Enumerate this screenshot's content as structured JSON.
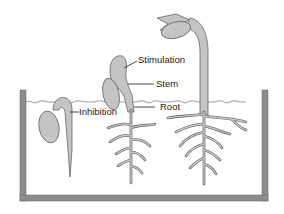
{
  "diagram": {
    "labels": {
      "stimulation": "Stimulation",
      "stem": "Stem",
      "root": "Root",
      "inhibition": "Inhibition"
    },
    "seedlings": [
      {
        "name": "early-seedling",
        "stage": "hook emerging from soil"
      },
      {
        "name": "middle-seedling",
        "stage": "bent shoot with developing roots"
      },
      {
        "name": "mature-seedling",
        "stage": "upright shoot with cotyledons and leaves"
      }
    ],
    "colors": {
      "plant_fill": "#c4c4c4",
      "outline": "#555555",
      "container": "#8c8c8c",
      "text": "#1a1a1a",
      "background": "#ffffff"
    }
  }
}
